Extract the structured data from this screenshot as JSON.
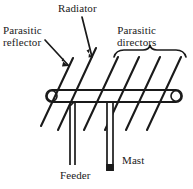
{
  "figure": {
    "background_color": "#ffffff",
    "ink_color": "#1a1a1a",
    "width": 193,
    "height": 189
  },
  "labels": {
    "parasitic_reflector": {
      "line1": "Parasitic",
      "line2": "reflector"
    },
    "radiator": "Radiator",
    "parasitic_directors": {
      "line1": "Parasitic",
      "line2": "directors"
    },
    "feeder": "Feeder",
    "mast": "Mast"
  },
  "parts": {
    "boom": "boom-tube",
    "reflector_element": "parasitic-reflector-element",
    "radiator_element": "radiator-element",
    "director_elements_count": "4",
    "feeder_line": "feeder-twin-line",
    "mast_tube": "mast-tube",
    "directors_brace": "curly-brace"
  },
  "leaders": {
    "reflector_leader": "arrow-to-reflector-element",
    "radiator_leader": "arrow-to-radiator-element"
  }
}
